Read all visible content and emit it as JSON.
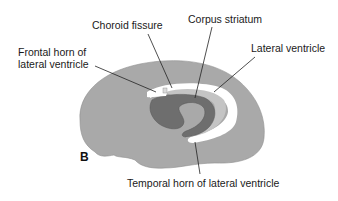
{
  "figure": {
    "panel_label": "B",
    "labels": {
      "choroid_fissure": "Choroid fissure",
      "corpus_striatum": "Corpus striatum",
      "frontal_horn_line1": "Frontal horn of",
      "frontal_horn_line2": "lateral ventricle",
      "lateral_ventricle": "Lateral ventricle",
      "temporal_horn": "Temporal horn of lateral ventricle"
    },
    "colors": {
      "hemisphere": "#a9a9a9",
      "corpus_striatum": "#6e6e6e",
      "ventricle": "#ffffff",
      "inner_band": "#c4c4c4",
      "leader_lines": "#222222",
      "text": "#1a1a1a"
    }
  }
}
